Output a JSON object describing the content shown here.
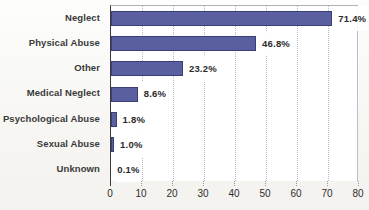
{
  "chart_data": {
    "type": "bar",
    "orientation": "horizontal",
    "title": "",
    "xlabel": "",
    "ylabel": "",
    "categories": [
      "Neglect",
      "Physical Abuse",
      "Other",
      "Medical Neglect",
      "Psychological Abuse",
      "Sexual Abuse",
      "Unknown"
    ],
    "values": [
      71.4,
      46.8,
      23.2,
      8.6,
      1.8,
      1.0,
      0.1
    ],
    "value_labels": [
      "71.4%",
      "46.8%",
      "23.2%",
      "8.6%",
      "1.8%",
      "1.0%",
      "0.1%"
    ],
    "x_ticks": [
      "0",
      "10",
      "20",
      "30",
      "40",
      "50",
      "60",
      "70",
      "80"
    ],
    "xlim": [
      0,
      80
    ],
    "grid": "vertical-dotted",
    "legend": "none",
    "bar_color": "#5a5f9f",
    "bar_border_color": "#3b3f76"
  }
}
